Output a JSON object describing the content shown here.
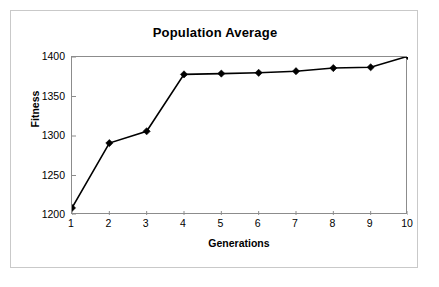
{
  "figure": {
    "background_color": "#ffffff",
    "frame_border_color": "#c9c9c9",
    "caption": ""
  },
  "chart_data": {
    "type": "line",
    "title": "Population Average",
    "xlabel": "Generations",
    "ylabel": "Fitness",
    "x": [
      1,
      2,
      3,
      4,
      5,
      6,
      7,
      8,
      9,
      10
    ],
    "categories": [
      "1",
      "2",
      "3",
      "4",
      "5",
      "6",
      "7",
      "8",
      "9",
      "10"
    ],
    "values": [
      1209,
      1291,
      1306,
      1378,
      1379,
      1380,
      1382,
      1386,
      1387,
      1401
    ],
    "series": [
      {
        "name": "Population Average",
        "values": [
          1209,
          1291,
          1306,
          1378,
          1379,
          1380,
          1382,
          1386,
          1387,
          1401
        ],
        "line_color": "#000000",
        "marker": "diamond",
        "marker_color": "#000000"
      }
    ],
    "ylim": [
      1200,
      1400
    ],
    "xlim": [
      1,
      10
    ],
    "yticks": [
      1200,
      1250,
      1300,
      1350,
      1400
    ],
    "ytick_labels": [
      "1200",
      "1250",
      "1300",
      "1350",
      "1400"
    ],
    "xticks": [
      1,
      2,
      3,
      4,
      5,
      6,
      7,
      8,
      9,
      10
    ],
    "xtick_labels": [
      "1",
      "2",
      "3",
      "4",
      "5",
      "6",
      "7",
      "8",
      "9",
      "10"
    ],
    "grid": false,
    "legend": false,
    "legend_position": "none",
    "plot_border_color": "#8c8c8c",
    "annotations": []
  }
}
